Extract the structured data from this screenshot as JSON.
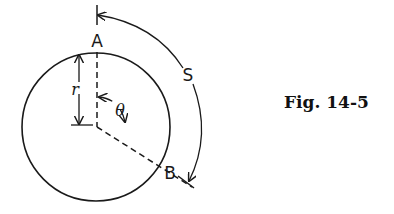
{
  "figure": {
    "caption": "Fig. 14-5",
    "labels": {
      "point_a": "A",
      "point_b": "B",
      "arc_length": "S",
      "radius": "r",
      "angle": "θ"
    },
    "colors": {
      "stroke": "#1a1a1a",
      "background": "#ffffff"
    }
  }
}
